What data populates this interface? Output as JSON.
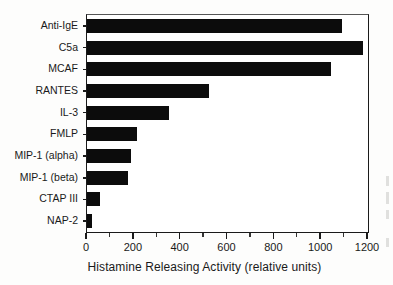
{
  "chart_data": {
    "type": "bar",
    "orientation": "horizontal",
    "title": "",
    "xlabel": "Histamine Releasing Activity (relative units)",
    "ylabel": "",
    "xlim": [
      0,
      1200
    ],
    "xticks": [
      0,
      200,
      400,
      600,
      800,
      1000,
      1200
    ],
    "xtick_labels": [
      "0",
      "200",
      "400",
      "600",
      "800",
      "1000",
      "1200"
    ],
    "minor_tick_interval": 100,
    "grid": false,
    "legend": null,
    "bar_color": "#0c0c0c",
    "categories": [
      "Anti-IgE",
      "C5a",
      "MCAF",
      "RANTES",
      "IL-3",
      "FMLP",
      "MIP-1 (alpha)",
      "MIP-1 (beta)",
      "CTAP III",
      "NAP-2"
    ],
    "values": [
      1090,
      1180,
      1040,
      520,
      350,
      215,
      190,
      175,
      55,
      20
    ],
    "bars": [
      {
        "label": "Anti-IgE",
        "value": 1090
      },
      {
        "label": "C5a",
        "value": 1180
      },
      {
        "label": "MCAF",
        "value": 1040
      },
      {
        "label": "RANTES",
        "value": 520
      },
      {
        "label": "IL-3",
        "value": 350
      },
      {
        "label": "FMLP",
        "value": 215
      },
      {
        "label": "MIP-1 (alpha)",
        "value": 190
      },
      {
        "label": "MIP-1 (beta)",
        "value": 175
      },
      {
        "label": "CTAP III",
        "value": 55
      },
      {
        "label": "NAP-2",
        "value": 20
      }
    ]
  }
}
